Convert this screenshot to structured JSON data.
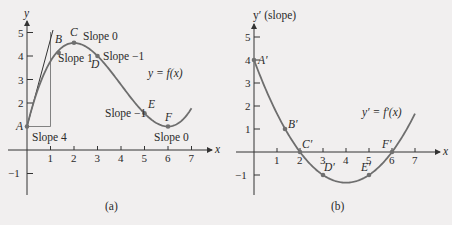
{
  "chart_data": [
    {
      "type": "line",
      "panel": "(a)",
      "title": "",
      "caption": "(a)",
      "xlabel": "x",
      "ylabel": "y",
      "curve_label": "y = f(x)",
      "function": "f(x) = 1 + x^3/9 - 4x^2/3 + 4x",
      "xlim": [
        0,
        7
      ],
      "ylim": [
        -1,
        5
      ],
      "x_ticks": [
        1,
        2,
        3,
        4,
        5,
        6,
        7
      ],
      "y_ticks": [
        -1,
        1,
        2,
        3,
        4,
        5
      ],
      "y_tick_labels": [
        "-1",
        "",
        "2",
        "3",
        "4",
        "5"
      ],
      "grid": false,
      "x": [
        0,
        0.5,
        1,
        1.35,
        2,
        2.5,
        3,
        3.5,
        4,
        4.5,
        5,
        5.5,
        6,
        6.5,
        7
      ],
      "y": [
        1.0,
        2.68,
        3.78,
        4.14,
        4.56,
        4.4,
        4.0,
        3.43,
        2.78,
        2.13,
        1.56,
        1.15,
        1.0,
        1.18,
        1.78
      ],
      "points": [
        {
          "label": "A",
          "x": 0,
          "y": 1.0,
          "annotation": "Slope 4"
        },
        {
          "label": "B",
          "x": 1.35,
          "y": 4.14,
          "annotation": "Slope 1"
        },
        {
          "label": "C",
          "x": 2,
          "y": 4.56,
          "annotation": "Slope 0"
        },
        {
          "label": "D",
          "x": 3,
          "y": 4.0,
          "annotation": "Slope −1"
        },
        {
          "label": "E",
          "x": 5,
          "y": 1.56,
          "annotation": "Slope −1"
        },
        {
          "label": "F",
          "x": 6,
          "y": 1.0,
          "annotation": "Slope 0"
        }
      ],
      "tangent_at_A": {
        "slope": 4,
        "run": 1,
        "rise": 4
      }
    },
    {
      "type": "line",
      "panel": "(b)",
      "title": "",
      "caption": "(b)",
      "xlabel": "x",
      "ylabel": "y′ (slope)",
      "curve_label": "y′ = f′(x)",
      "function": "f'(x) = (x-2)(x-6)/3",
      "xlim": [
        0,
        7
      ],
      "ylim": [
        -1,
        5
      ],
      "x_ticks": [
        1,
        2,
        3,
        4,
        5,
        6,
        7
      ],
      "y_ticks": [
        -1,
        1,
        2,
        3,
        4,
        5
      ],
      "grid": false,
      "x": [
        0,
        0.5,
        1,
        1.35,
        2,
        2.5,
        3,
        3.5,
        4,
        4.5,
        5,
        5.5,
        6,
        6.5,
        7
      ],
      "y": [
        4.0,
        2.75,
        1.67,
        1.0,
        0.0,
        -0.58,
        -1.0,
        -1.25,
        -1.33,
        -1.25,
        -1.0,
        -0.58,
        0.0,
        0.75,
        1.67
      ],
      "points": [
        {
          "label": "A′",
          "x": 0,
          "y": 4
        },
        {
          "label": "B′",
          "x": 1.35,
          "y": 1
        },
        {
          "label": "C′",
          "x": 2,
          "y": 0
        },
        {
          "label": "D′",
          "x": 3,
          "y": -1
        },
        {
          "label": "E′",
          "x": 5,
          "y": -1
        },
        {
          "label": "F′",
          "x": 6,
          "y": 0
        }
      ]
    }
  ],
  "panels": {
    "a": {
      "ylabel": "y",
      "xlabel": "x",
      "curve_label": "y = f(x)",
      "caption": "(a)",
      "ticks_x": [
        "1",
        "2",
        "3",
        "4",
        "5",
        "6",
        "7"
      ],
      "ticks_y": {
        "m1": "−1",
        "two": "2",
        "three": "3",
        "four": "4",
        "five": "5"
      },
      "points": {
        "A": "A",
        "B": "B",
        "C": "C",
        "D": "D",
        "E": "E",
        "F": "F"
      },
      "annotations": {
        "A": "Slope 4",
        "B": "Slope 1",
        "C": "Slope 0",
        "D": "Slope −1",
        "E": "Slope −1",
        "F": "Slope 0"
      }
    },
    "b": {
      "ylabel": "y′ (slope)",
      "xlabel": "x",
      "curve_label": "y′ = f′(x)",
      "caption": "(b)",
      "ticks_x": [
        "1",
        "2",
        "3",
        "4",
        "5",
        "6",
        "7"
      ],
      "ticks_y": {
        "m1": "−1",
        "one": "1",
        "two": "2",
        "three": "3",
        "four": "4",
        "five": "5"
      },
      "points": {
        "A": "A′",
        "B": "B′",
        "C": "C′",
        "D": "D′",
        "E": "E′",
        "F": "F′"
      }
    }
  },
  "colors": {
    "background": "#f1efef",
    "curve": "#6e6e6e",
    "axis": "#333333",
    "point": "#707070"
  }
}
